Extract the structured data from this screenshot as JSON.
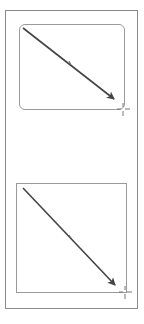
{
  "canvas": {
    "background": "#ffffff",
    "frame_color": "#8a8a8a",
    "shape_border_color": "#9a9a9a",
    "arrow_color": "#444444"
  },
  "shapes": [
    {
      "type": "rounded-rectangle",
      "label": "",
      "x": 19,
      "y": 24,
      "w": 106,
      "h": 86
    },
    {
      "type": "rectangle",
      "label": "",
      "x": 16,
      "y": 183,
      "w": 111,
      "h": 110
    }
  ],
  "arrows": [
    {
      "x1": 23,
      "y1": 28,
      "x2": 114,
      "y2": 99
    },
    {
      "x1": 23,
      "y1": 188,
      "x2": 115,
      "y2": 285
    }
  ],
  "cursors": [
    {
      "icon": "crosshair-cursor",
      "x": 123,
      "y": 109
    },
    {
      "icon": "crosshair-cursor",
      "x": 125,
      "y": 292
    }
  ]
}
